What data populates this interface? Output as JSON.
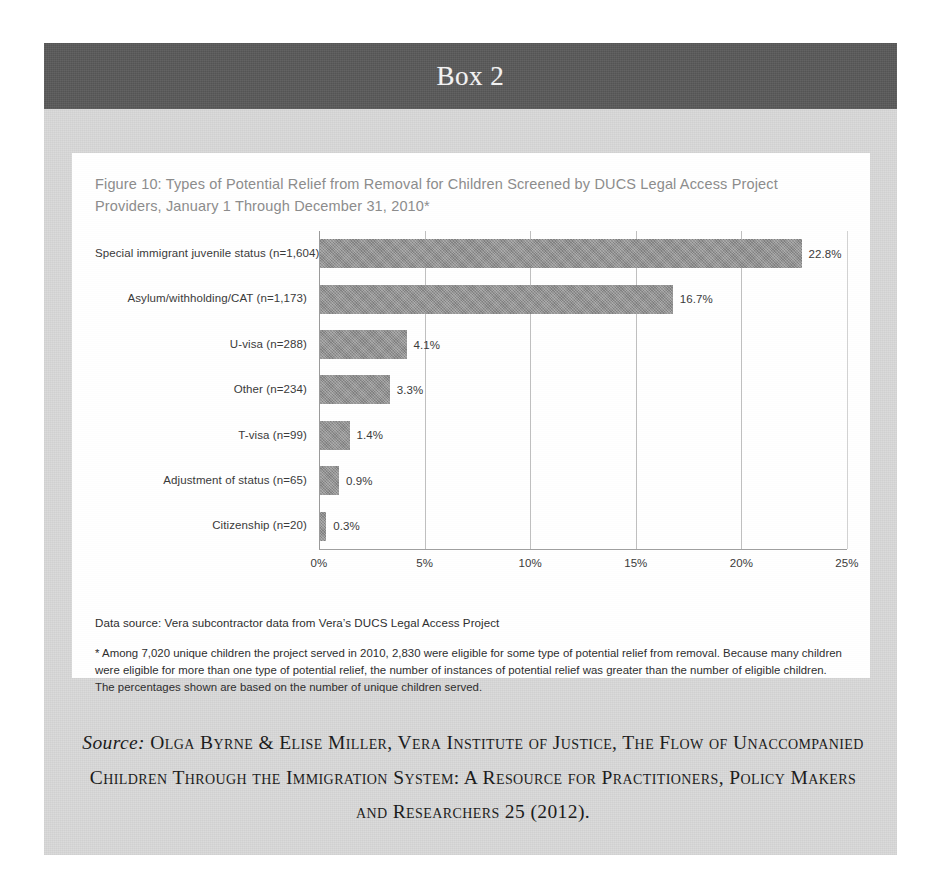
{
  "box": {
    "header_title": "Box 2"
  },
  "figure": {
    "caption": "Figure 10: Types of Potential Relief from Removal for Children Screened by DUCS Legal Access Project Providers, January 1 Through December 31, 2010*",
    "data_source_note": "Data source: Vera subcontractor data from Vera’s DUCS Legal Access Project",
    "asterisk_note": "* Among 7,020 unique children the project served in 2010, 2,830 were eligible for some type of potential relief from removal. Because many children were eligible for more than one type of potential relief, the number of instances of potential relief was greater than the number of eligible children. The percentages shown are based on the number of unique children served."
  },
  "source": {
    "label": "Source:",
    "citation": " Olga Byrne & Elise Miller, Vera Institute of Justice, The Flow of Unaccompanied Children Through the Immigration System:  A Resource for Practitioners, Policy Makers and Researchers 25 (2012)."
  },
  "colors": {
    "box_background": "#d9d9d9",
    "header_band": "#595959",
    "panel_background": "#ffffff",
    "bar_fill": "#8f8f8f",
    "gridline": "#bfbfbf",
    "caption_text": "#8c8c8c"
  },
  "chart_data": {
    "type": "bar",
    "orientation": "horizontal",
    "title": "Figure 10: Types of Potential Relief from Removal for Children Screened by DUCS Legal Access Project Providers, January 1 Through December 31, 2010*",
    "xlabel": "",
    "ylabel": "",
    "xlim": [
      0,
      25
    ],
    "xticks": [
      0,
      5,
      10,
      15,
      20,
      25
    ],
    "xtick_labels": [
      "0%",
      "5%",
      "10%",
      "15%",
      "20%",
      "25%"
    ],
    "grid": true,
    "legend": false,
    "categories": [
      "Special immigrant juvenile status (n=1,604)",
      "Asylum/withholding/CAT (n=1,173)",
      "U-visa (n=288)",
      "Other (n=234)",
      "T-visa (n=99)",
      "Adjustment of status (n=65)",
      "Citizenship (n=20)"
    ],
    "values": [
      22.8,
      16.7,
      4.1,
      3.3,
      1.4,
      0.9,
      0.3
    ],
    "value_labels": [
      "22.8%",
      "16.7%",
      "4.1%",
      "3.3%",
      "1.4%",
      "0.9%",
      "0.3%"
    ],
    "counts": [
      1604,
      1173,
      288,
      234,
      99,
      65,
      20
    ]
  }
}
